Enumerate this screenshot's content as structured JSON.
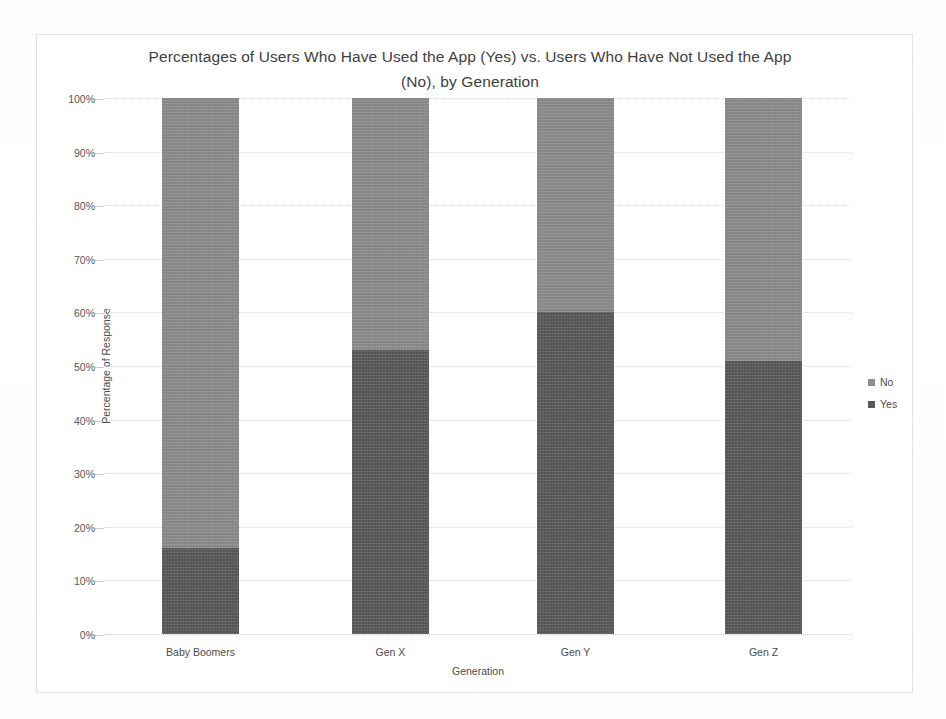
{
  "chart_data": {
    "type": "bar",
    "subtype": "stacked-100-percent",
    "title": "Percentages of Users Who Have Used the App (Yes) vs. Users Who Have Not Used the App (No), by Generation",
    "title_lines": [
      "Percentages of Users Who Have Used the  App (Yes) vs. Users Who Have Not Used the App",
      "(No), by Generation"
    ],
    "xlabel": "Generation",
    "ylabel": "Percentage of Response",
    "categories": [
      "Baby Boomers",
      "Gen X",
      "Gen Y",
      "Gen Z"
    ],
    "series": [
      {
        "name": "No",
        "values": [
          84,
          47,
          40,
          49
        ],
        "color": "#8d8d8d"
      },
      {
        "name": "Yes",
        "values": [
          16,
          53,
          60,
          51
        ],
        "color": "#5a5a5a"
      }
    ],
    "stack_order_bottom_to_top": [
      "Yes",
      "No"
    ],
    "ylim": [
      0,
      100
    ],
    "ytick_values": [
      0,
      10,
      20,
      30,
      40,
      50,
      60,
      70,
      80,
      90,
      100
    ],
    "ytick_labels": [
      "0%",
      "10%",
      "20%",
      "30%",
      "40%",
      "50%",
      "60%",
      "70%",
      "80%",
      "90%",
      "100%"
    ],
    "grid": true,
    "legend_position": "right",
    "legend_entries": [
      {
        "label": "No",
        "marker": "square-swatch",
        "color": "#8d8d8d"
      },
      {
        "label": "Yes",
        "marker": "square-swatch",
        "color": "#5a5a5a"
      }
    ]
  },
  "colors": {
    "no": "#8d8d8d",
    "yes": "#5a5a5a",
    "gridline": "#d8d8d8",
    "frame": "#e2e2e2",
    "text": "#4a4a4a",
    "background": "#ffffff"
  }
}
